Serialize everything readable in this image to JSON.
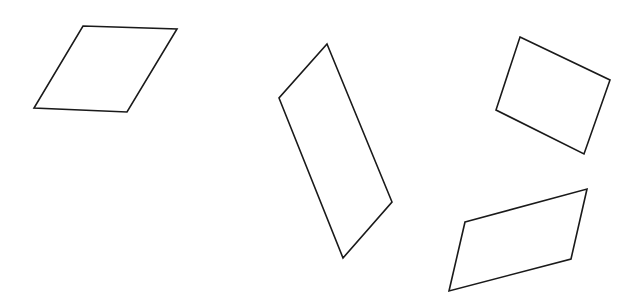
{
  "diagram": {
    "title": "",
    "shape_count": 4,
    "shapes": [
      {
        "name": "parallelogram-1",
        "kind": "parallelogram",
        "stroke": "#1a1a1a",
        "fill": "none"
      },
      {
        "name": "parallelogram-2",
        "kind": "parallelogram",
        "stroke": "#1a1a1a",
        "fill": "none"
      },
      {
        "name": "quadrilateral-3",
        "kind": "rectangle",
        "stroke": "#1a1a1a",
        "fill": "none"
      },
      {
        "name": "parallelogram-4",
        "kind": "parallelogram",
        "stroke": "#1a1a1a",
        "fill": "none"
      }
    ],
    "background": "#ffffff"
  }
}
